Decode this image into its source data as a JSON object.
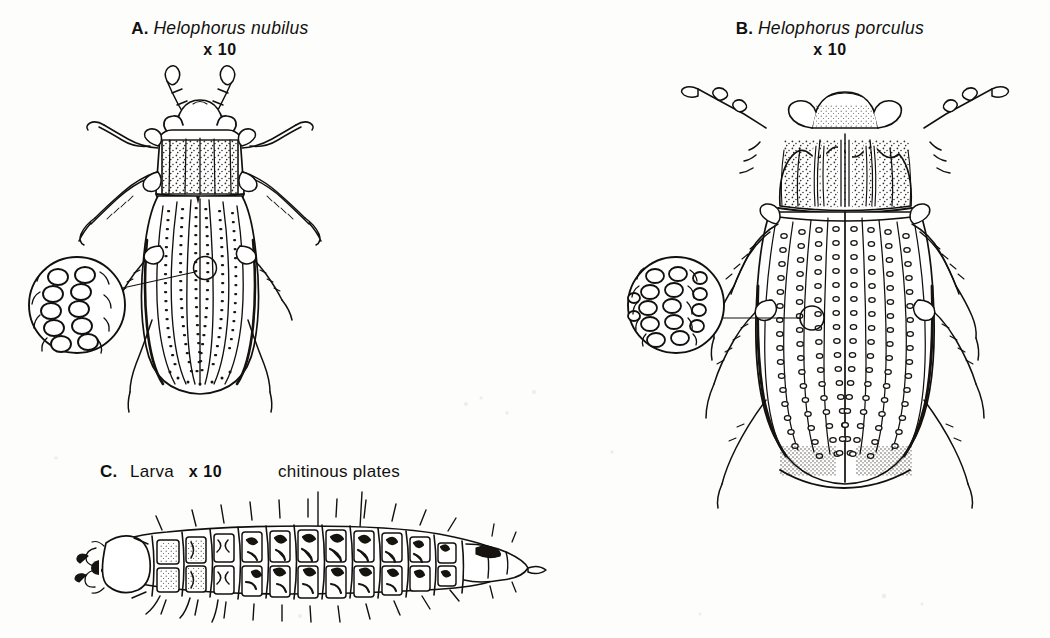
{
  "plate": {
    "background_color": "#fdfdfc",
    "ink_color": "#12100e",
    "medium": "pen-and-ink scientific illustration",
    "figure_count": 3
  },
  "figures": {
    "a": {
      "letter": "A.",
      "species": "Helophorus nubilus",
      "magnification": "x 10",
      "subject": "adult beetle, dorsal view",
      "inset": {
        "name": "elytral-puncture-detail",
        "shape": "circle",
        "description": "magnified elytral punctation, oval punctures in rows",
        "rows": 5,
        "columns": 2
      }
    },
    "b": {
      "letter": "B.",
      "species": "Helophorus porculus",
      "magnification": "x 10",
      "subject": "adult beetle, dorsal view",
      "inset": {
        "name": "elytral-puncture-detail",
        "shape": "circle",
        "description": "magnified elytral punctation, dense oval punctures in rows",
        "rows": 5,
        "columns": 3
      }
    },
    "c": {
      "letter": "C.",
      "label": "Larva",
      "magnification": "x 10",
      "subject": "larva, dorsal view",
      "annotation": "chitinous plates",
      "segments": 12
    }
  },
  "labels": {
    "chitinous_plates": "chitinous plates"
  }
}
